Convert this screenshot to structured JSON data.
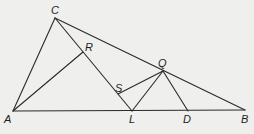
{
  "diagram": {
    "type": "geometry-triangle",
    "points": {
      "A": {
        "x": 13,
        "y": 111,
        "label": "A",
        "lx": 4,
        "ly": 123
      },
      "B": {
        "x": 245,
        "y": 110,
        "label": "B",
        "lx": 241,
        "ly": 123
      },
      "C": {
        "x": 55,
        "y": 18,
        "label": "C",
        "lx": 51,
        "ly": 14
      },
      "L": {
        "x": 132,
        "y": 111,
        "label": "L",
        "lx": 129,
        "ly": 123
      },
      "D": {
        "x": 188,
        "y": 111,
        "label": "D",
        "lx": 183,
        "ly": 123
      },
      "Q": {
        "x": 163,
        "y": 71,
        "label": "Q",
        "lx": 158,
        "ly": 67
      },
      "R": {
        "x": 83,
        "y": 52,
        "label": "R",
        "lx": 85,
        "ly": 51
      },
      "S": {
        "x": 118,
        "y": 94,
        "label": "S",
        "lx": 115,
        "ly": 92
      }
    },
    "segments": [
      [
        "A",
        "B"
      ],
      [
        "A",
        "C"
      ],
      [
        "C",
        "B"
      ],
      [
        "C",
        "L"
      ],
      [
        "A",
        "R"
      ],
      [
        "S",
        "Q"
      ],
      [
        "L",
        "Q"
      ],
      [
        "Q",
        "D"
      ]
    ],
    "labels": [
      "A",
      "B",
      "C",
      "L",
      "D",
      "Q",
      "R",
      "S"
    ]
  }
}
